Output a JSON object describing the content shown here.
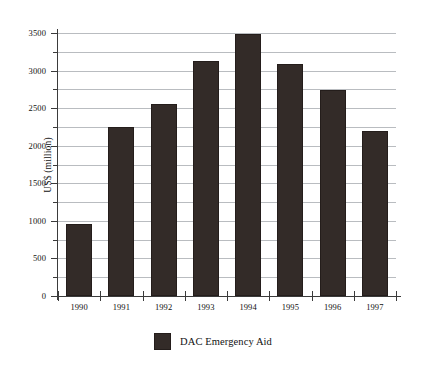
{
  "chart_data": {
    "type": "bar",
    "title": "",
    "xlabel": "",
    "ylabel": "US$ (million)",
    "categories": [
      "1990",
      "1991",
      "1992",
      "1993",
      "1994",
      "1995",
      "1996",
      "1997"
    ],
    "values": [
      960,
      2250,
      2550,
      3130,
      3490,
      3090,
      2740,
      2200
    ],
    "series": [
      {
        "name": "DAC Emergency Aid",
        "color": "#332b28",
        "values": [
          960,
          2250,
          2550,
          3130,
          3490,
          3090,
          2740,
          2200
        ]
      }
    ],
    "ylim": [
      0,
      3500
    ],
    "y_ticks": [
      0,
      500,
      1000,
      1500,
      2000,
      2500,
      3000,
      3500
    ],
    "y_tick_labels": [
      "0",
      "500",
      "1000",
      "1500",
      "2000",
      "2500",
      "3000",
      "3500"
    ],
    "y_minor_ticks": [
      250,
      750,
      1250,
      1750,
      2250,
      2750,
      3250
    ],
    "grid": true,
    "grid_axis": "y",
    "legend_position": "bottom",
    "legend_entries": [
      "DAC Emergency Aid"
    ],
    "background_color": "#ffffff",
    "gridline_color": "#b9bcc0",
    "axis_color": "#3b3b3b"
  }
}
